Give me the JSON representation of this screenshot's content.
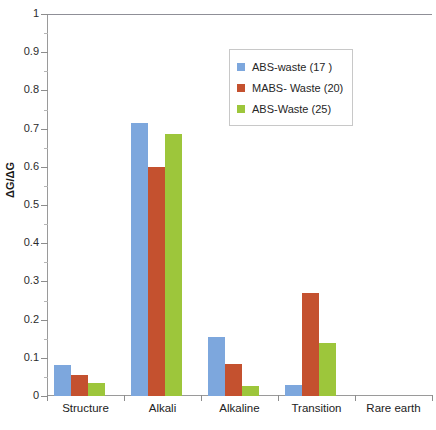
{
  "chart_data": {
    "type": "bar",
    "title": "",
    "xlabel": "",
    "ylabel": "ΔG/ΔG",
    "ylim": [
      0,
      1
    ],
    "ytick_step": 0.1,
    "ytick_labels": [
      "1",
      "0.9",
      "0.8",
      "0.7",
      "0.6",
      "0.5",
      "0.4",
      "0.3",
      "0.2",
      "0.1",
      "0"
    ],
    "grid": false,
    "legend_position": "top-right",
    "categories": [
      "Structure",
      "Alkali",
      "Alkaline",
      "Transition",
      "Rare earth"
    ],
    "series": [
      {
        "name": "ABS-waste (17 )",
        "color": "#7da7dd",
        "values": [
          0.08,
          0.715,
          0.155,
          0.03,
          0
        ]
      },
      {
        "name": "MABS- Waste (20)",
        "color": "#c4512f",
        "values": [
          0.055,
          0.6,
          0.085,
          0.27,
          0
        ]
      },
      {
        "name": "ABS-Waste (25)",
        "color": "#9dc63b",
        "values": [
          0.035,
          0.685,
          0.025,
          0.14,
          0
        ]
      }
    ]
  },
  "axis": {
    "y_title": "ΔG/ΔG"
  },
  "legend": {
    "items": [
      {
        "label": "ABS-waste (17 )",
        "color": "#7da7dd"
      },
      {
        "label": "MABS- Waste (20)",
        "color": "#c4512f"
      },
      {
        "label": "ABS-Waste (25)",
        "color": "#9dc63b"
      }
    ]
  }
}
